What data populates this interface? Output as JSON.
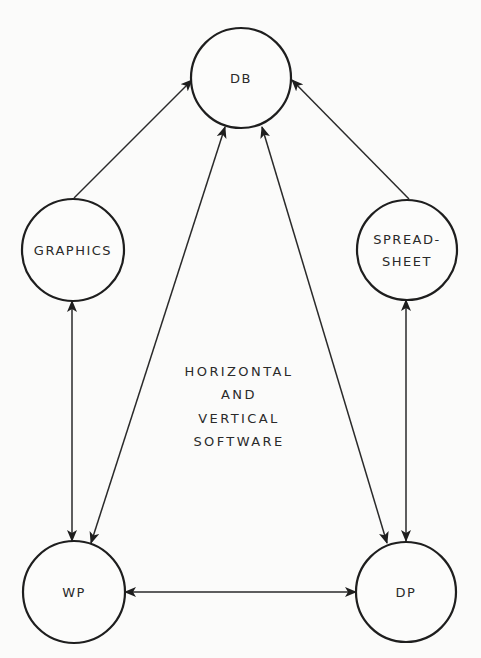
{
  "diagram": {
    "type": "node-link",
    "background": "#fbfbfa",
    "stroke_color": "#1e1e1e",
    "center_label": {
      "lines": [
        "HORIZONTAL",
        "AND",
        "VERTICAL",
        "SOFTWARE"
      ],
      "x": 239,
      "ys": [
        371,
        394,
        418,
        441
      ]
    },
    "nodes": [
      {
        "id": "db",
        "label_lines": [
          "DB"
        ],
        "cx": 241,
        "cy": 78,
        "r": 50
      },
      {
        "id": "graphics",
        "label_lines": [
          "GRAPHICS"
        ],
        "cx": 73,
        "cy": 250,
        "r": 51
      },
      {
        "id": "spreadsheet",
        "label_lines": [
          "SPREAD-",
          "SHEET"
        ],
        "cx": 407,
        "cy": 250,
        "r": 50
      },
      {
        "id": "wp",
        "label_lines": [
          "WP"
        ],
        "cx": 74,
        "cy": 592,
        "r": 51
      },
      {
        "id": "dp",
        "label_lines": [
          "DP"
        ],
        "cx": 406,
        "cy": 592,
        "r": 50
      }
    ],
    "edges": [
      {
        "from": "graphics",
        "to": "db",
        "direction": "to",
        "x1": 74,
        "y1": 198,
        "x2": 192,
        "y2": 80
      },
      {
        "from": "spreadsheet",
        "to": "db",
        "direction": "to",
        "x1": 409,
        "y1": 199,
        "x2": 292,
        "y2": 80
      },
      {
        "from": "db",
        "to": "wp",
        "direction": "both",
        "x1": 225,
        "y1": 127,
        "x2": 91,
        "y2": 543
      },
      {
        "from": "db",
        "to": "dp",
        "direction": "both",
        "x1": 262,
        "y1": 127,
        "x2": 387,
        "y2": 543
      },
      {
        "from": "graphics",
        "to": "wp",
        "direction": "both",
        "x1": 72,
        "y1": 301,
        "x2": 72,
        "y2": 541
      },
      {
        "from": "spreadsheet",
        "to": "dp",
        "direction": "both",
        "x1": 406,
        "y1": 300,
        "x2": 406,
        "y2": 541
      },
      {
        "from": "wp",
        "to": "dp",
        "direction": "both",
        "x1": 125,
        "y1": 592,
        "x2": 356,
        "y2": 592
      }
    ]
  }
}
